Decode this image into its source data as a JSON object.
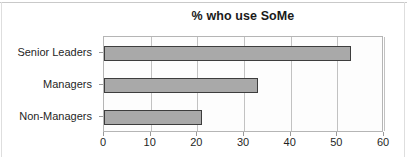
{
  "chart_data": {
    "type": "bar",
    "orientation": "horizontal",
    "title": "% who use SoMe",
    "categories": [
      "Senior Leaders",
      "Managers",
      "Non-Managers"
    ],
    "values": [
      53,
      33,
      21
    ],
    "xlabel": "",
    "ylabel": "",
    "xlim": [
      0,
      60
    ],
    "xticks": [
      "0",
      "10",
      "20",
      "30",
      "40",
      "50",
      "60"
    ],
    "xtick_values": [
      0,
      10,
      20,
      30,
      40,
      50,
      60
    ],
    "grid": "vertical",
    "legend": "none",
    "bar_color": "#a9a9a9",
    "bar_border_color": "#3d3d3d",
    "plot_border_color": "#b5b5b5",
    "gridline_color": "#c2c2c2",
    "title_color": "#1a1a1a",
    "background_color": "#ffffff"
  }
}
